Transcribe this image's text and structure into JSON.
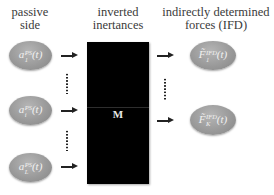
{
  "headers": {
    "passive_side": [
      "passive",
      "side"
    ],
    "inverted_inertances": [
      "inverted",
      "inertances"
    ],
    "ifd": [
      "indirectly determined",
      "forces (IFD)"
    ]
  },
  "passive_side_nodes": [
    {
      "base": "a",
      "sup": "PS",
      "sub": "1",
      "arg": "(t)"
    },
    {
      "base": "a",
      "sup": "PS",
      "sub": "i",
      "arg": "(t)"
    },
    {
      "base": "a",
      "sup": "PS",
      "sub": "L",
      "arg": "(t)"
    }
  ],
  "matrix": {
    "label": "M",
    "color": "#000000"
  },
  "ifd_nodes": [
    {
      "base": "F̃",
      "sup": "IFD",
      "sub": "1",
      "arg": "(t)"
    },
    {
      "base": "F̃",
      "sup": "IFD",
      "sub": "K",
      "arg": "(t)"
    }
  ],
  "colors": {
    "node_fill": "#9a9a9a",
    "node_text": "#f2f2f2",
    "arrow": "#222222",
    "text": "#3a3a3a"
  }
}
